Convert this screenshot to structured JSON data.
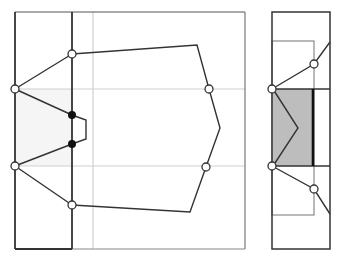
{
  "diagram": {
    "colors": {
      "frame": "#333333",
      "gridline": "#c8c8c8",
      "polygon_edge": "#333333",
      "light_fill": "#f4f4f4",
      "shaded_fill": "#bdbdbd",
      "inner_rect": "#888888",
      "open_node_fill": "#ffffff",
      "filled_node": "#111111"
    },
    "left_panel": {
      "frame": {
        "x1": 15,
        "y1": 12,
        "x2": 245,
        "y2": 249
      },
      "fold_line_x": 72,
      "gray_vertical_x": 93,
      "gray_horizontals_y": [
        89,
        166
      ],
      "polygon": [
        [
          72,
          54
        ],
        [
          197,
          45
        ],
        [
          209,
          89
        ],
        [
          220,
          128
        ],
        [
          206,
          167
        ],
        [
          190,
          212
        ],
        [
          72,
          205
        ]
      ],
      "left_fan": {
        "apex_top": [
          15,
          89
        ],
        "apex_bottom": [
          15,
          166
        ],
        "edges": [
          [
            [
              15,
              89
            ],
            [
              72,
              54
            ]
          ],
          [
            [
              15,
              89
            ],
            [
              72,
              115
            ]
          ],
          [
            [
              15,
              166
            ],
            [
              72,
              144
            ]
          ],
          [
            [
              15,
              166
            ],
            [
              72,
              205
            ]
          ]
        ]
      },
      "notch": [
        [
          72,
          115
        ],
        [
          86,
          120
        ],
        [
          86,
          139
        ],
        [
          72,
          144
        ]
      ],
      "open_nodes": [
        [
          72,
          54
        ],
        [
          15,
          89
        ],
        [
          15,
          166
        ],
        [
          72,
          205
        ],
        [
          209,
          89
        ],
        [
          206,
          167
        ]
      ],
      "filled_nodes": [
        [
          72,
          115
        ],
        [
          72,
          144
        ]
      ]
    },
    "right_panel": {
      "frame": {
        "x1": 272,
        "y1": 12,
        "x2": 330,
        "y2": 249
      },
      "inner_rect": {
        "x1": 272,
        "y1": 41,
        "x2": 314,
        "y2": 215
      },
      "shaded_region": {
        "x1": 273,
        "y1": 89,
        "x2": 313,
        "y2": 166
      },
      "thick_line_x": 313,
      "horizontals_y": [
        89,
        166
      ],
      "zigzag": [
        [
          273,
          89
        ],
        [
          298,
          128
        ],
        [
          273,
          166
        ]
      ],
      "upper_path": [
        [
          272,
          89
        ],
        [
          314,
          64
        ],
        [
          330,
          42
        ]
      ],
      "lower_path": [
        [
          272,
          166
        ],
        [
          314,
          189
        ],
        [
          330,
          214
        ]
      ],
      "open_nodes": [
        [
          272,
          89
        ],
        [
          314,
          64
        ],
        [
          272,
          166
        ],
        [
          314,
          189
        ]
      ]
    }
  }
}
